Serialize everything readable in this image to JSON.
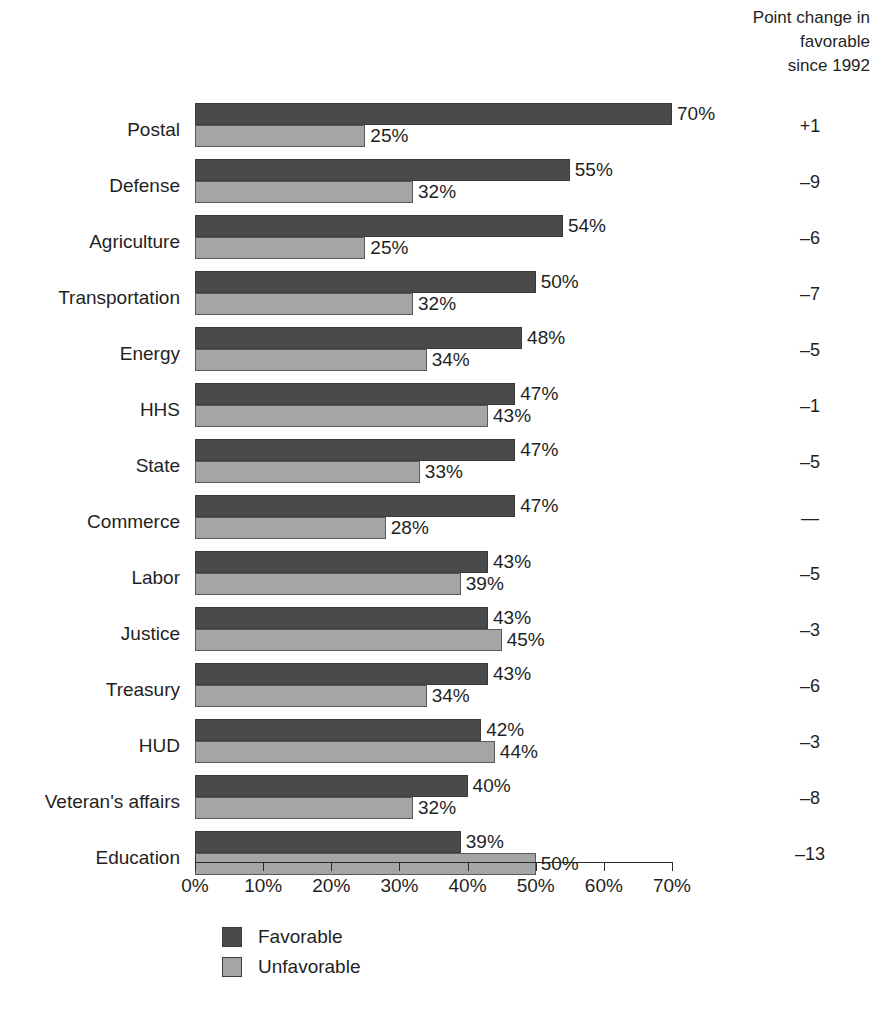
{
  "header": {
    "column_title": "Point change in\nfavorable\nsince 1992"
  },
  "legend": {
    "items": [
      {
        "label": "Favorable",
        "color": "#4a4a4a",
        "key": "fav"
      },
      {
        "label": "Unfavorable",
        "color": "#a5a5a5",
        "key": "unfav"
      }
    ]
  },
  "axis": {
    "ticks": [
      "0%",
      "10%",
      "20%",
      "30%",
      "40%",
      "50%",
      "60%",
      "70%"
    ],
    "min": 0,
    "max": 70
  },
  "chart_data": {
    "type": "bar",
    "orientation": "horizontal",
    "title": "",
    "xlabel": "",
    "ylabel": "",
    "xlim": [
      0,
      70
    ],
    "grid": false,
    "legend_position": "bottom-left",
    "categories": [
      "Postal",
      "Defense",
      "Agriculture",
      "Transportation",
      "Energy",
      "HHS",
      "State",
      "Commerce",
      "Labor",
      "Justice",
      "Treasury",
      "HUD",
      "Veteran's affairs",
      "Education"
    ],
    "series": [
      {
        "name": "Favorable",
        "color": "#4a4a4a",
        "values": [
          70,
          55,
          54,
          50,
          48,
          47,
          47,
          47,
          43,
          43,
          43,
          42,
          40,
          39
        ],
        "labels": [
          "70%",
          "55%",
          "54%",
          "50%",
          "48%",
          "47%",
          "47%",
          "47%",
          "43%",
          "43%",
          "43%",
          "42%",
          "40%",
          "39%"
        ]
      },
      {
        "name": "Unfavorable",
        "color": "#a5a5a5",
        "values": [
          25,
          32,
          25,
          32,
          34,
          43,
          33,
          28,
          39,
          45,
          34,
          44,
          32,
          50
        ],
        "labels": [
          "25%",
          "32%",
          "25%",
          "32%",
          "34%",
          "43%",
          "33%",
          "28%",
          "39%",
          "45%",
          "34%",
          "44%",
          "32%",
          "50%"
        ]
      }
    ],
    "annotations": {
      "name": "Point change in favorable since 1992",
      "values": [
        "+1",
        "–9",
        "–6",
        "–7",
        "–5",
        "–1",
        "–5",
        "—",
        "–5",
        "–3",
        "–6",
        "–3",
        "–8",
        "–13"
      ]
    }
  }
}
